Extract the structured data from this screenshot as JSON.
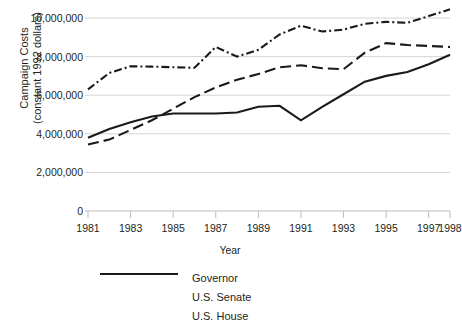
{
  "chart_data": {
    "type": "line",
    "title": "",
    "xlabel": "Year",
    "ylabel": "Campaign Costs\n(constant 1992 dollars)",
    "xlim": [
      1981,
      1998
    ],
    "ylim": [
      0,
      10600000
    ],
    "grid": true,
    "legend_position": "bottom",
    "ytick_labels": [
      "10,000,000",
      "8,000,000",
      "6,000,000",
      "4,000,000",
      "2,000,000",
      "0"
    ],
    "ytick_values": [
      10000000,
      8000000,
      6000000,
      4000000,
      2000000,
      0
    ],
    "xtick_labels": [
      "1981",
      "1983",
      "1985",
      "1987",
      "1989",
      "1991",
      "1993",
      "1995",
      "1997",
      "1998"
    ],
    "xtick_values": [
      1981,
      1983,
      1985,
      1987,
      1989,
      1991,
      1993,
      1995,
      1997,
      1998
    ],
    "x": [
      1981,
      1982,
      1983,
      1984,
      1985,
      1986,
      1987,
      1988,
      1989,
      1990,
      1991,
      1992,
      1993,
      1994,
      1995,
      1996,
      1997,
      1998
    ],
    "series": [
      {
        "name": "Governor",
        "style": "dashdot",
        "color": "#1a1a1a",
        "values": [
          6300000,
          7150000,
          7500000,
          7480000,
          7450000,
          7420000,
          8500000,
          8000000,
          8350000,
          9150000,
          9600000,
          9300000,
          9400000,
          9700000,
          9800000,
          9750000,
          10100000,
          10450000
        ]
      },
      {
        "name": "U.S. Senate",
        "style": "dashed",
        "color": "#1a1a1a",
        "values": [
          3450000,
          3700000,
          4200000,
          4700000,
          5300000,
          5900000,
          6400000,
          6800000,
          7100000,
          7450000,
          7550000,
          7400000,
          7350000,
          8200000,
          8700000,
          8600000,
          8550000,
          8500000
        ]
      },
      {
        "name": "U.S. House",
        "style": "solid",
        "color": "#1a1a1a",
        "values": [
          3800000,
          4250000,
          4600000,
          4900000,
          5050000,
          5050000,
          5050000,
          5100000,
          5400000,
          5450000,
          4700000,
          5400000,
          6050000,
          6700000,
          7000000,
          7200000,
          7600000,
          8100000
        ]
      }
    ]
  },
  "legend": {
    "items": [
      {
        "label": "Governor",
        "style": "dashdot"
      },
      {
        "label": "U.S. Senate",
        "style": "dashed"
      },
      {
        "label": "U.S. House",
        "style": "solid"
      }
    ]
  },
  "colors": {
    "line": "#1a1a1a",
    "grid": "#d4d4d4",
    "axis": "#bdbdbd",
    "text": "#231f20"
  }
}
